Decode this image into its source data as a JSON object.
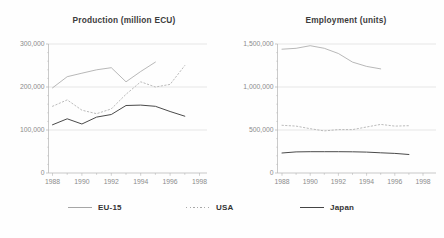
{
  "styles": {
    "grid_color": "#d7d7d7",
    "axis_color": "#b3b3b3",
    "tick_label_color": "#8c8c8c",
    "title_color": "#3c3c3c"
  },
  "chart_data": [
    {
      "type": "line",
      "title": "Production (million ECU)",
      "x_start": 1988,
      "x_end": 1998,
      "x_ticks": [
        1988,
        1990,
        1992,
        1994,
        1996,
        1998
      ],
      "ylim": [
        0,
        300000
      ],
      "y_major_step": 100000,
      "y_minor_step": 20000,
      "y_tick_labels": [
        "0",
        "100,000",
        "200,000",
        "300,000"
      ],
      "grid": true,
      "series": [
        {
          "name": "EU-15",
          "x_start": 1988,
          "color": "#a6a6a6",
          "width": 0.8,
          "dash": "",
          "values": [
            198000,
            224000,
            232000,
            240000,
            245000,
            212000,
            236000,
            258000
          ]
        },
        {
          "name": "USA",
          "x_start": 1988,
          "color": "#b3b3b3",
          "width": 0.9,
          "dash": "1.4 2.2",
          "values": [
            155000,
            170000,
            146000,
            138000,
            149000,
            183000,
            212000,
            200000,
            206000,
            250000
          ]
        },
        {
          "name": "Japan",
          "x_start": 1988,
          "color": "#4a4a4a",
          "width": 1,
          "dash": "",
          "values": [
            112000,
            126000,
            114000,
            130000,
            136000,
            157000,
            158000,
            155000,
            143000,
            132000
          ]
        }
      ]
    },
    {
      "type": "line",
      "title": "Employment (units)",
      "x_start": 1988,
      "x_end": 1998,
      "x_ticks": [
        1988,
        1990,
        1992,
        1994,
        1996,
        1998
      ],
      "ylim": [
        0,
        1500000
      ],
      "y_major_step": 500000,
      "y_minor_step": 100000,
      "y_tick_labels": [
        "0",
        "500,000",
        "1,000,000",
        "1,500,000"
      ],
      "grid": true,
      "series": [
        {
          "name": "EU-15",
          "x_start": 1988,
          "color": "#a6a6a6",
          "width": 0.8,
          "dash": "",
          "values": [
            1440000,
            1450000,
            1480000,
            1450000,
            1390000,
            1290000,
            1240000,
            1210000
          ]
        },
        {
          "name": "USA",
          "x_start": 1988,
          "color": "#b3b3b3",
          "width": 0.9,
          "dash": "1.4 2.2",
          "values": [
            555000,
            545000,
            515000,
            490000,
            505000,
            505000,
            535000,
            565000,
            545000,
            550000
          ]
        },
        {
          "name": "Japan",
          "x_start": 1988,
          "color": "#4a4a4a",
          "width": 1,
          "dash": "",
          "values": [
            233000,
            245000,
            248000,
            248000,
            248000,
            246000,
            243000,
            235000,
            228000,
            215000
          ]
        }
      ]
    }
  ],
  "legend": {
    "items": [
      {
        "label": "EU-15",
        "style": "solid",
        "color": "#a6a6a6"
      },
      {
        "label": "USA",
        "style": "dotted",
        "color": "#a8a8a8"
      },
      {
        "label": "Japan",
        "style": "solid",
        "color": "#444444"
      }
    ]
  }
}
